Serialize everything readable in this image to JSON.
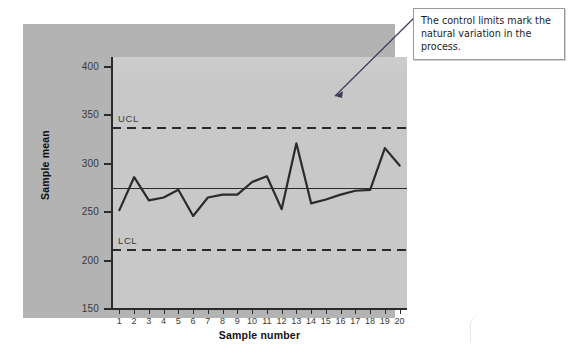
{
  "figure": {
    "panel_bg": "#b3b3b3",
    "plot_bg": "#c8c8c8",
    "line_color": "#2b2b2b"
  },
  "axes": {
    "y_title": "Sample mean",
    "x_title": "Sample number",
    "y_ticks": [
      400,
      350,
      300,
      250,
      200,
      150
    ],
    "x_ticks": [
      1,
      2,
      3,
      4,
      5,
      6,
      7,
      8,
      9,
      10,
      11,
      12,
      13,
      14,
      15,
      16,
      17,
      18,
      19,
      20
    ]
  },
  "reference_lines": [
    {
      "name": "UCL",
      "label": "UCL",
      "value": 338,
      "style": "dashed"
    },
    {
      "name": "center",
      "label": "",
      "value": 275,
      "style": "solid"
    },
    {
      "name": "LCL",
      "label": "LCL",
      "value": 212,
      "style": "dashed"
    }
  ],
  "callout": {
    "line1": "The control limits mark the",
    "line2": "natural variation in the process."
  },
  "chart_data": {
    "type": "line",
    "title": "",
    "xlabel": "Sample number",
    "ylabel": "Sample mean",
    "xlim": [
      0.5,
      20.5
    ],
    "ylim": [
      150,
      410
    ],
    "grid": false,
    "legend": "none",
    "x": [
      1,
      2,
      3,
      4,
      5,
      6,
      7,
      8,
      9,
      10,
      11,
      12,
      13,
      14,
      15,
      16,
      17,
      18,
      19,
      20
    ],
    "values": [
      252,
      286,
      262,
      265,
      273,
      246,
      265,
      268,
      268,
      281,
      287,
      253,
      321,
      259,
      263,
      268,
      272,
      273,
      316,
      298
    ],
    "series": [
      {
        "name": "Sample mean",
        "values": [
          252,
          286,
          262,
          265,
          273,
          246,
          265,
          268,
          268,
          281,
          287,
          253,
          321,
          259,
          263,
          268,
          272,
          273,
          316,
          298
        ]
      }
    ],
    "annotations": [
      {
        "name": "UCL",
        "text": "UCL",
        "y": 338
      },
      {
        "name": "LCL",
        "text": "LCL",
        "y": 212
      },
      {
        "name": "callout",
        "text": "The control limits mark the natural variation in the process.",
        "points_to": "UCL"
      }
    ]
  }
}
